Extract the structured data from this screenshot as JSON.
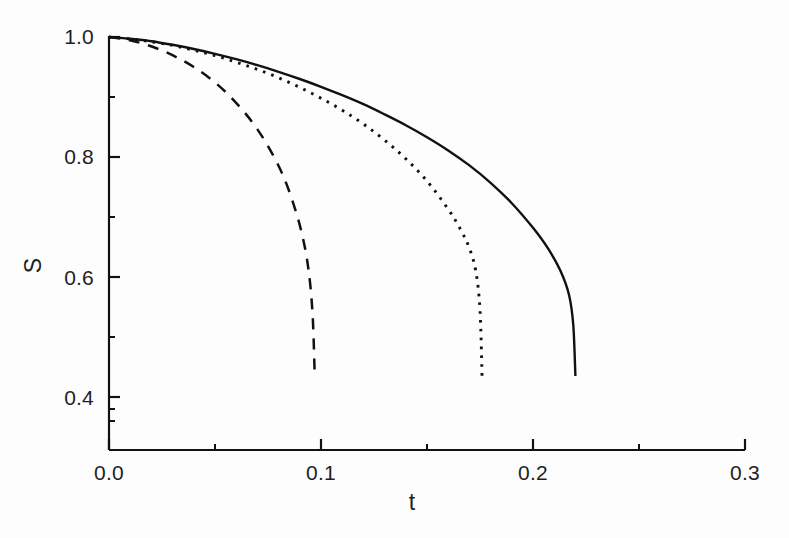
{
  "chart_data": {
    "type": "line",
    "title": "",
    "subtitle": "",
    "xlabel": "t",
    "ylabel": "S",
    "xlim": [
      0.0,
      0.3
    ],
    "ylim": [
      0.33,
      1.0
    ],
    "xticks": [
      0.0,
      0.1,
      0.2,
      0.3
    ],
    "xtick_labels": [
      "0.0",
      "0.1",
      "0.2",
      "0.3"
    ],
    "yticks": [
      0.4,
      0.6,
      0.8,
      1.0
    ],
    "ytick_labels": [
      "0.4",
      "0.6",
      "0.8",
      "1.0"
    ],
    "x_minor_ticks": [
      0.05,
      0.15,
      0.25
    ],
    "y_minor_ticks": [
      0.5,
      0.7,
      0.9
    ],
    "grid": false,
    "legend": null,
    "annotations": [],
    "series": [
      {
        "name": "solid",
        "style": "solid",
        "color": "#111111",
        "x": [
          0.0,
          0.01,
          0.02,
          0.03,
          0.04,
          0.05,
          0.06,
          0.07,
          0.08,
          0.09,
          0.1,
          0.11,
          0.12,
          0.13,
          0.14,
          0.15,
          0.16,
          0.17,
          0.18,
          0.19,
          0.2,
          0.207,
          0.213,
          0.217,
          0.219,
          0.22
        ],
        "y": [
          1.0,
          0.997,
          0.993,
          0.987,
          0.98,
          0.972,
          0.963,
          0.953,
          0.942,
          0.93,
          0.917,
          0.903,
          0.888,
          0.871,
          0.853,
          0.833,
          0.811,
          0.786,
          0.757,
          0.723,
          0.682,
          0.648,
          0.61,
          0.57,
          0.52,
          0.435
        ]
      },
      {
        "name": "dotted",
        "style": "dotted",
        "color": "#111111",
        "x": [
          0.0,
          0.01,
          0.02,
          0.03,
          0.04,
          0.05,
          0.06,
          0.07,
          0.08,
          0.09,
          0.1,
          0.11,
          0.12,
          0.13,
          0.14,
          0.15,
          0.16,
          0.166,
          0.17,
          0.173,
          0.175,
          0.176
        ],
        "y": [
          1.0,
          0.997,
          0.992,
          0.986,
          0.978,
          0.969,
          0.958,
          0.946,
          0.932,
          0.916,
          0.898,
          0.878,
          0.855,
          0.828,
          0.797,
          0.76,
          0.713,
          0.678,
          0.648,
          0.61,
          0.545,
          0.43
        ]
      },
      {
        "name": "dashed",
        "style": "dashed",
        "color": "#111111",
        "x": [
          0.0,
          0.008,
          0.016,
          0.024,
          0.032,
          0.04,
          0.048,
          0.056,
          0.064,
          0.07,
          0.076,
          0.082,
          0.087,
          0.091,
          0.094,
          0.096,
          0.097
        ],
        "y": [
          1.0,
          0.996,
          0.989,
          0.979,
          0.966,
          0.95,
          0.93,
          0.905,
          0.874,
          0.846,
          0.812,
          0.77,
          0.722,
          0.672,
          0.615,
          0.54,
          0.44
        ]
      }
    ]
  },
  "axes": {
    "x_axis_label": "t",
    "y_axis_label": "S"
  }
}
